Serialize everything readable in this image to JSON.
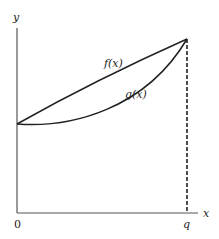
{
  "diagram": {
    "axes": {
      "x_label": "x",
      "y_label": "y",
      "origin_label": "0",
      "q_label": "q"
    },
    "curves": [
      {
        "name": "f",
        "label": "f(x)",
        "shape": "slightly concave, above g"
      },
      {
        "name": "g",
        "label": "g(x)",
        "shape": "convex, below f"
      }
    ],
    "marker": {
      "type": "dashed-vertical-line",
      "at": "q"
    },
    "colors": {
      "line": "#222222",
      "background": "#ffffff"
    }
  }
}
